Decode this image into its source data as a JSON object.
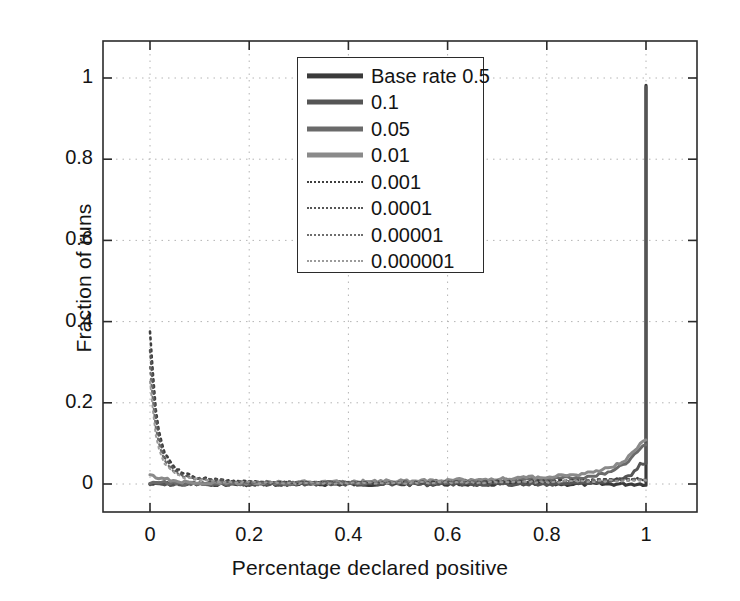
{
  "chart_data": {
    "type": "line",
    "title": "",
    "xlabel": "Percentage declared positive",
    "ylabel": "Fraction of runs",
    "xlim": [
      -0.1,
      1.1
    ],
    "ylim": [
      -0.1,
      1.1
    ],
    "xticks": [
      "0",
      "0.2",
      "0.4",
      "0.6",
      "0.8",
      "1"
    ],
    "xtick_values": [
      0,
      0.2,
      0.4,
      0.6,
      0.8,
      1
    ],
    "yticks": [
      "0",
      "0.2",
      "0.4",
      "0.6",
      "0.8",
      "1"
    ],
    "ytick_values": [
      0,
      0.2,
      0.4,
      0.6,
      0.8,
      1
    ],
    "grid": true,
    "grid_style": "dotted",
    "legend_position": "upper center",
    "series": [
      {
        "name": "Base rate 0.5",
        "label": "Base rate 0.5",
        "color": "#3a3a3a",
        "style": "solid",
        "width": 3.2,
        "x": [
          0.0,
          0.05,
          0.1,
          0.2,
          0.3,
          0.4,
          0.5,
          0.6,
          0.7,
          0.8,
          0.9,
          0.95,
          0.98,
          0.99,
          1.0
        ],
        "y": [
          0.0,
          0.0,
          0.0,
          0.0,
          0.0,
          0.0,
          0.0,
          0.0,
          0.0,
          0.0,
          0.0,
          0.0,
          0.0,
          0.0,
          0.982
        ]
      },
      {
        "name": "0.1",
        "label": "0.1",
        "color": "#555555",
        "style": "solid",
        "width": 3.0,
        "x": [
          0.0,
          0.05,
          0.1,
          0.2,
          0.3,
          0.4,
          0.5,
          0.6,
          0.7,
          0.8,
          0.9,
          0.94,
          0.97,
          0.99,
          1.0
        ],
        "y": [
          0.0,
          0.0,
          0.0,
          0.0,
          0.0,
          0.0,
          0.0,
          0.0,
          0.0,
          0.0,
          0.004,
          0.008,
          0.02,
          0.05,
          0.978
        ]
      },
      {
        "name": "0.05",
        "label": "0.05",
        "color": "#6a6a6a",
        "style": "solid",
        "width": 3.0,
        "x": [
          0.0,
          0.05,
          0.1,
          0.2,
          0.3,
          0.4,
          0.5,
          0.6,
          0.7,
          0.8,
          0.88,
          0.93,
          0.96,
          0.985,
          1.0
        ],
        "y": [
          0.005,
          0.002,
          0.001,
          0.001,
          0.002,
          0.003,
          0.004,
          0.006,
          0.008,
          0.012,
          0.018,
          0.03,
          0.05,
          0.085,
          0.1
        ]
      },
      {
        "name": "0.01",
        "label": "0.01",
        "color": "#8a8a8a",
        "style": "solid",
        "width": 3.0,
        "x": [
          0.0,
          0.05,
          0.1,
          0.2,
          0.3,
          0.4,
          0.5,
          0.6,
          0.7,
          0.8,
          0.88,
          0.93,
          0.96,
          0.985,
          1.0
        ],
        "y": [
          0.02,
          0.006,
          0.004,
          0.003,
          0.004,
          0.005,
          0.007,
          0.009,
          0.012,
          0.018,
          0.026,
          0.04,
          0.06,
          0.095,
          0.108
        ]
      },
      {
        "name": "0.001",
        "label": "0.001",
        "color": "#3f3f3f",
        "style": "dotted",
        "width": 2.6,
        "x": [
          0.0,
          0.01,
          0.02,
          0.03,
          0.05,
          0.07,
          0.1,
          0.15,
          0.2,
          0.3,
          0.4,
          0.5,
          0.6,
          0.7,
          0.8,
          0.9,
          1.0
        ],
        "y": [
          0.375,
          0.2,
          0.115,
          0.075,
          0.04,
          0.025,
          0.015,
          0.008,
          0.005,
          0.003,
          0.003,
          0.003,
          0.004,
          0.005,
          0.007,
          0.01,
          0.012
        ]
      },
      {
        "name": "0.0001",
        "label": "0.0001",
        "color": "#565656",
        "style": "dotted",
        "width": 2.4,
        "x": [
          0.0,
          0.01,
          0.02,
          0.03,
          0.05,
          0.07,
          0.1,
          0.15,
          0.2,
          0.3,
          0.4,
          0.5,
          0.6,
          0.7,
          0.8,
          0.9,
          1.0
        ],
        "y": [
          0.33,
          0.175,
          0.1,
          0.065,
          0.034,
          0.021,
          0.013,
          0.007,
          0.005,
          0.003,
          0.003,
          0.003,
          0.004,
          0.005,
          0.006,
          0.009,
          0.011
        ]
      },
      {
        "name": "0.00001",
        "label": "0.00001",
        "color": "#6e6e6e",
        "style": "dotted",
        "width": 2.2,
        "x": [
          0.0,
          0.01,
          0.02,
          0.03,
          0.05,
          0.07,
          0.1,
          0.15,
          0.2,
          0.3,
          0.4,
          0.5,
          0.6,
          0.7,
          0.8,
          0.9,
          1.0
        ],
        "y": [
          0.29,
          0.15,
          0.086,
          0.056,
          0.03,
          0.018,
          0.011,
          0.006,
          0.004,
          0.003,
          0.003,
          0.003,
          0.003,
          0.004,
          0.006,
          0.008,
          0.01
        ]
      },
      {
        "name": "0.000001",
        "label": "0.000001",
        "color": "#9b9b9b",
        "style": "dotted",
        "width": 2.0,
        "x": [
          0.0,
          0.01,
          0.02,
          0.03,
          0.05,
          0.07,
          0.1,
          0.15,
          0.2,
          0.3,
          0.4,
          0.5,
          0.6,
          0.7,
          0.8,
          0.9,
          1.0
        ],
        "y": [
          0.25,
          0.13,
          0.075,
          0.048,
          0.026,
          0.016,
          0.01,
          0.005,
          0.004,
          0.002,
          0.002,
          0.003,
          0.003,
          0.004,
          0.005,
          0.007,
          0.009
        ]
      }
    ]
  }
}
